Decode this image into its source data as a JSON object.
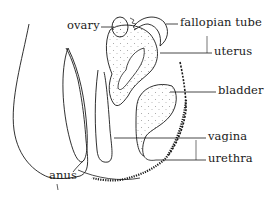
{
  "diagram": {
    "type": "anatomical cross-section",
    "labels": {
      "ovary": "ovary",
      "fallopian_tube": "fallopian tube",
      "uterus": "uterus",
      "bladder": "bladder",
      "vagina": "vagina",
      "urethra": "urethra",
      "anus": "anus"
    },
    "colors": {
      "line": "#1a1a1a",
      "background": "#ffffff",
      "stipple": "#555555"
    }
  }
}
